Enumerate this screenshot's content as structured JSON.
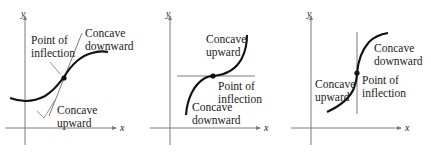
{
  "colors": {
    "curve": "#111111",
    "tangent": "#7a7a7a",
    "axis": "#7a7a7a",
    "text": "#1a1a1a",
    "background": "#ffffff"
  },
  "panels": [
    {
      "id": "panel-1",
      "axis_x_label": "x",
      "axis_y_label": "y",
      "tangent_orientation": "oblique",
      "labels": {
        "inflection_line1": "Point of",
        "inflection_line2": "inflection",
        "down_line1": "Concave",
        "down_line2": "downward",
        "up_line1": "Concave",
        "up_line2": "upward"
      }
    },
    {
      "id": "panel-2",
      "axis_x_label": "x",
      "axis_y_label": "y",
      "tangent_orientation": "horizontal",
      "labels": {
        "up_line1": "Concave",
        "up_line2": "upward",
        "inflection_line1": "Point of",
        "inflection_line2": "inflection",
        "down_line1": "Concave",
        "down_line2": "downward"
      }
    },
    {
      "id": "panel-3",
      "axis_x_label": "x",
      "axis_y_label": "y",
      "tangent_orientation": "vertical",
      "labels": {
        "down_line1": "Concave",
        "down_line2": "downward",
        "up_line1": "Concave",
        "up_line2": "upward",
        "inflection_line1": "Point of",
        "inflection_line2": "inflection"
      }
    }
  ]
}
